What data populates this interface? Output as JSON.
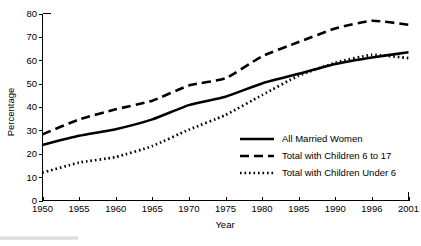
{
  "chart_data": {
    "type": "line",
    "title": "",
    "xlabel": "Year",
    "ylabel": "Percentage",
    "grid": false,
    "legend_position": "inside-lower-right",
    "x": [
      1950,
      1955,
      1960,
      1965,
      1970,
      1975,
      1980,
      1985,
      1990,
      1996,
      2001
    ],
    "xtick_labels": [
      "1950",
      "1955",
      "1960",
      "1965",
      "1970",
      "1975",
      "1980",
      "1985",
      "1990",
      "1996",
      "2001"
    ],
    "ytick_labels": [
      "0",
      "10",
      "20",
      "30",
      "40",
      "50",
      "60",
      "70",
      "80"
    ],
    "ylim": [
      0,
      80
    ],
    "ytick_step": 10,
    "series": [
      {
        "name": "All Married Women",
        "style": "solid",
        "color": "#000000",
        "values": [
          23.8,
          27.7,
          30.5,
          34.7,
          40.8,
          44.4,
          50.1,
          54.2,
          58.4,
          61.2,
          63.4
        ]
      },
      {
        "name": "Total with Children 6 to 17",
        "style": "dashed",
        "color": "#000000",
        "values": [
          28.3,
          34.7,
          39.0,
          42.7,
          49.2,
          52.3,
          61.7,
          67.8,
          73.6,
          76.9,
          75.2
        ]
      },
      {
        "name": "Total with Children Under 6",
        "style": "dotted",
        "color": "#000000",
        "values": [
          11.9,
          16.2,
          18.6,
          23.3,
          30.3,
          36.6,
          45.1,
          53.4,
          58.9,
          62.3,
          60.9
        ]
      }
    ]
  },
  "legend": {
    "items": [
      {
        "label": "All Married Women",
        "style": "solid"
      },
      {
        "label": "Total with Children 6 to 17",
        "style": "dashed"
      },
      {
        "label": "Total with Children Under 6",
        "style": "dotted"
      }
    ]
  },
  "axes": {
    "y_title": "Percentage",
    "x_title": "Year"
  }
}
